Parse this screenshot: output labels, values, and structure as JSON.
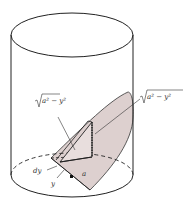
{
  "figure": {
    "colors": {
      "stroke": "#222222",
      "shade": "#ddd0cf",
      "background": "#ffffff"
    },
    "labels": {
      "sqrt_left": "√a² − y²",
      "sqrt_right": "√a² − y²",
      "dy": "dy",
      "y": "y",
      "a": "a"
    }
  }
}
